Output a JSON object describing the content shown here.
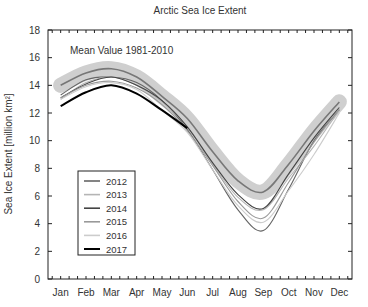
{
  "chart_data": {
    "type": "line",
    "title": "Arctic Sea Ice Extent",
    "xlabel": "",
    "ylabel": "Sea Ice Extent [million km²]",
    "ylim": [
      0,
      18
    ],
    "yticks": [
      0,
      2,
      4,
      6,
      8,
      10,
      12,
      14,
      16,
      18
    ],
    "categories": [
      "Jan",
      "Feb",
      "Mar",
      "Apr",
      "May",
      "Jun",
      "Jul",
      "Aug",
      "Sep",
      "Oct",
      "Nov",
      "Dec"
    ],
    "annotation": "Mean Value 1981-2010",
    "grid": false,
    "legend_position": "lower-left",
    "mean": {
      "name": "Mean 1981-2010",
      "values": [
        14.0,
        14.9,
        15.2,
        14.6,
        13.2,
        11.6,
        9.2,
        7.1,
        6.3,
        8.3,
        10.7,
        12.8
      ],
      "band_half_width": 0.55,
      "color": "#777777",
      "band_color": "#cfcfcf"
    },
    "series": [
      {
        "name": "2012",
        "color": "#666666",
        "values": [
          13.3,
          14.4,
          14.6,
          14.2,
          12.9,
          10.8,
          7.9,
          5.0,
          3.5,
          6.5,
          10.0,
          12.2
        ]
      },
      {
        "name": "2013",
        "color": "#b5b5b5",
        "values": [
          13.0,
          14.2,
          14.6,
          14.0,
          12.8,
          11.0,
          8.3,
          5.9,
          5.0,
          7.3,
          9.6,
          12.2
        ]
      },
      {
        "name": "2014",
        "color": "#444444",
        "values": [
          13.1,
          14.1,
          14.6,
          14.0,
          12.9,
          11.0,
          8.4,
          6.1,
          5.1,
          7.6,
          10.2,
          12.4
        ]
      },
      {
        "name": "2015",
        "color": "#999999",
        "values": [
          13.1,
          14.0,
          14.3,
          13.8,
          12.6,
          10.7,
          8.2,
          5.6,
          4.4,
          7.0,
          9.9,
          12.3
        ]
      },
      {
        "name": "2016",
        "color": "#cccccc",
        "values": [
          13.0,
          13.9,
          14.2,
          13.7,
          12.2,
          10.6,
          7.9,
          5.3,
          4.1,
          6.4,
          9.0,
          12.0
        ]
      },
      {
        "name": "2017",
        "color": "#000000",
        "values": [
          12.5,
          13.5,
          14.0,
          13.4,
          12.2,
          10.9,
          null,
          null,
          null,
          null,
          null,
          null
        ]
      }
    ]
  }
}
